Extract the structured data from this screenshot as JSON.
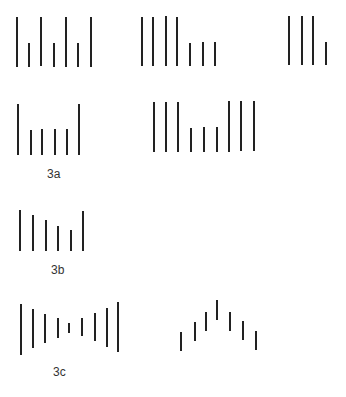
{
  "figure": {
    "background": "#ffffff",
    "stroke_color": "#222222",
    "stroke_width": 2,
    "groups": [
      {
        "name": "row1-group-a",
        "lines": [
          {
            "x": 17,
            "y1": 17,
            "y2": 67
          },
          {
            "x": 29,
            "y1": 43,
            "y2": 67
          },
          {
            "x": 41,
            "y1": 17,
            "y2": 66
          },
          {
            "x": 54,
            "y1": 43,
            "y2": 67
          },
          {
            "x": 66,
            "y1": 17,
            "y2": 67
          },
          {
            "x": 78,
            "y1": 43,
            "y2": 67
          },
          {
            "x": 91,
            "y1": 17,
            "y2": 67
          }
        ]
      },
      {
        "name": "row1-group-b",
        "lines": [
          {
            "x": 142,
            "y1": 17,
            "y2": 66
          },
          {
            "x": 153,
            "y1": 17,
            "y2": 66
          },
          {
            "x": 166,
            "y1": 16,
            "y2": 66
          },
          {
            "x": 177,
            "y1": 17,
            "y2": 66
          },
          {
            "x": 190,
            "y1": 43,
            "y2": 66
          },
          {
            "x": 203,
            "y1": 42,
            "y2": 66
          },
          {
            "x": 215,
            "y1": 42,
            "y2": 66
          }
        ]
      },
      {
        "name": "row1-group-c",
        "lines": [
          {
            "x": 289,
            "y1": 16,
            "y2": 65
          },
          {
            "x": 302,
            "y1": 16,
            "y2": 65
          },
          {
            "x": 313,
            "y1": 16,
            "y2": 65
          },
          {
            "x": 326,
            "y1": 42,
            "y2": 65
          }
        ]
      },
      {
        "name": "row2-group-a",
        "lines": [
          {
            "x": 18,
            "y1": 104,
            "y2": 155
          },
          {
            "x": 31,
            "y1": 130,
            "y2": 155
          },
          {
            "x": 42,
            "y1": 129,
            "y2": 155
          },
          {
            "x": 55,
            "y1": 129,
            "y2": 155
          },
          {
            "x": 67,
            "y1": 129,
            "y2": 155
          },
          {
            "x": 79,
            "y1": 104,
            "y2": 155
          }
        ]
      },
      {
        "name": "row2-group-b",
        "lines": [
          {
            "x": 154,
            "y1": 102,
            "y2": 152
          },
          {
            "x": 166,
            "y1": 102,
            "y2": 152
          },
          {
            "x": 178,
            "y1": 102,
            "y2": 152
          },
          {
            "x": 191,
            "y1": 128,
            "y2": 152
          },
          {
            "x": 204,
            "y1": 127,
            "y2": 152
          },
          {
            "x": 217,
            "y1": 127,
            "y2": 152
          },
          {
            "x": 229,
            "y1": 101,
            "y2": 152
          },
          {
            "x": 241,
            "y1": 101,
            "y2": 151
          },
          {
            "x": 254,
            "y1": 101,
            "y2": 151
          }
        ]
      },
      {
        "name": "row3-group-3b",
        "lines": [
          {
            "x": 20,
            "y1": 210,
            "y2": 251
          },
          {
            "x": 33,
            "y1": 215,
            "y2": 251
          },
          {
            "x": 46,
            "y1": 220,
            "y2": 251
          },
          {
            "x": 58,
            "y1": 226,
            "y2": 251
          },
          {
            "x": 71,
            "y1": 230,
            "y2": 251
          },
          {
            "x": 83,
            "y1": 211,
            "y2": 251
          }
        ]
      },
      {
        "name": "row4-group-3c-left",
        "lines": [
          {
            "x": 21,
            "y1": 304,
            "y2": 355
          },
          {
            "x": 33,
            "y1": 309,
            "y2": 348
          },
          {
            "x": 45,
            "y1": 314,
            "y2": 343
          },
          {
            "x": 58,
            "y1": 318,
            "y2": 338
          },
          {
            "x": 69,
            "y1": 323,
            "y2": 333
          },
          {
            "x": 82,
            "y1": 318,
            "y2": 336
          },
          {
            "x": 95,
            "y1": 313,
            "y2": 341
          },
          {
            "x": 107,
            "y1": 308,
            "y2": 347
          },
          {
            "x": 118,
            "y1": 302,
            "y2": 352
          }
        ]
      },
      {
        "name": "row4-group-3c-right",
        "lines": [
          {
            "x": 181,
            "y1": 332,
            "y2": 351
          },
          {
            "x": 195,
            "y1": 322,
            "y2": 341
          },
          {
            "x": 206,
            "y1": 312,
            "y2": 331
          },
          {
            "x": 217,
            "y1": 300,
            "y2": 320
          },
          {
            "x": 230,
            "y1": 312,
            "y2": 331
          },
          {
            "x": 243,
            "y1": 321,
            "y2": 340
          },
          {
            "x": 256,
            "y1": 331,
            "y2": 350
          }
        ]
      }
    ],
    "labels": [
      {
        "id": "label-3a",
        "text": "3a",
        "x": 47,
        "y": 168
      },
      {
        "id": "label-3b",
        "text": "3b",
        "x": 51,
        "y": 264
      },
      {
        "id": "label-3c",
        "text": "3c",
        "x": 53,
        "y": 366
      }
    ]
  }
}
